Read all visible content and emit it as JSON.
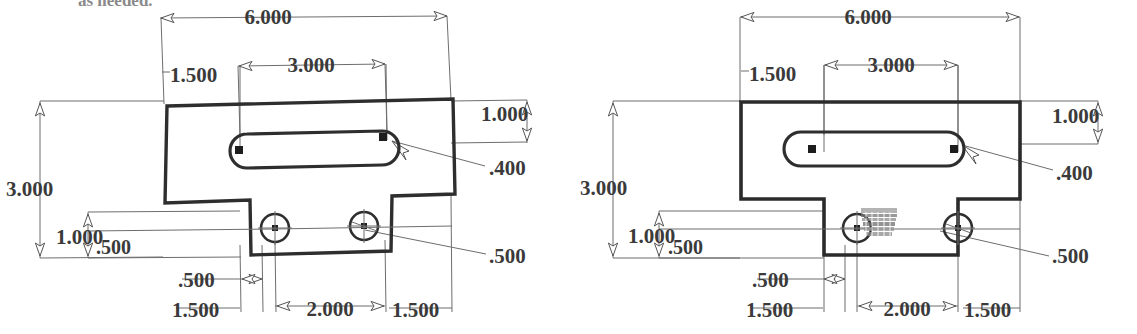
{
  "page": {
    "background_color": "#ffffff",
    "object_line_color": "#2e2e2e",
    "dimension_line_color": "#6d6d6d",
    "text_color": "#3a3a3a",
    "width": 1137,
    "height": 334
  },
  "top_note": {
    "text": "as needed.",
    "clipped": true
  },
  "views": [
    {
      "id": "left-view",
      "name": "skewed-scan-view",
      "skewed": true,
      "rotation_deg": -1.4,
      "dimensions": {
        "overall_width": "6.000",
        "overall_height": "3.000",
        "slot_offset_left": "1.500",
        "slot_length": "3.000",
        "top_band_height": "1.000",
        "slot_width": ".400",
        "step_height": "1.000",
        "tab_offset": ".500",
        "left_step_width": "1.500",
        "hole_spacing": "2.000",
        "right_step_width": "1.500",
        "hole_diameter": ".500",
        "notch_width": ".500"
      },
      "labels": {
        "dim_6000": "6.000",
        "dim_3000_top": "3.000",
        "dim_1500_top": "1.500",
        "dim_3000_left": "3.000",
        "dim_1000_left": "1.000",
        "dim_500_left": ".500",
        "dim_1000_right": "1.000",
        "dim_400": ".400",
        "dim_500_right": ".500",
        "dim_500_bottom": ".500",
        "dim_1500_bottom_left": "1.500",
        "dim_2000_bottom": "2.000",
        "dim_1500_bottom_right": "1.500"
      }
    },
    {
      "id": "right-view",
      "name": "orthogonal-clean-view",
      "skewed": false,
      "rotation_deg": 0,
      "dimensions": {
        "overall_width": "6.000",
        "overall_height": "3.000",
        "slot_offset_left": "1.500",
        "slot_length": "3.000",
        "top_band_height": "1.000",
        "slot_width": ".400",
        "step_height": "1.000",
        "tab_offset": ".500",
        "left_step_width": "1.500",
        "hole_spacing": "2.000",
        "right_step_width": "1.500",
        "hole_diameter": ".500",
        "notch_width": ".500"
      },
      "labels": {
        "dim_6000": "6.000",
        "dim_3000_top": "3.000",
        "dim_1500_top": "1.500",
        "dim_3000_left": "3.000",
        "dim_1000_left": "1.000",
        "dim_500_left": ".500",
        "dim_1000_right": "1.000",
        "dim_400": ".400",
        "dim_500_right": ".500",
        "dim_500_bottom": ".500",
        "dim_1500_bottom_left": "1.500",
        "dim_2000_bottom": "2.000",
        "dim_1500_bottom_right": "1.500"
      },
      "artifact": {
        "name": "smudged-erased-text",
        "legible": false,
        "text": ""
      }
    }
  ]
}
